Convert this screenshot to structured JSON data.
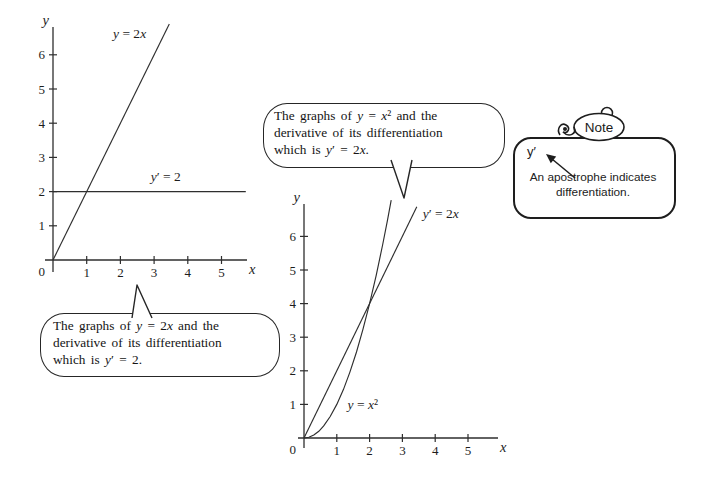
{
  "palette": {
    "ink": "#2e2e2e",
    "paper": "#ffffff"
  },
  "chart_data": [
    {
      "type": "line",
      "title": "",
      "xlabel": "x",
      "ylabel": "y",
      "origin_label": "0",
      "x_ticks": [
        1,
        2,
        3,
        4,
        5
      ],
      "y_ticks": [
        1,
        2,
        3,
        4,
        5,
        6
      ],
      "xlim": [
        0,
        5.9
      ],
      "ylim": [
        0,
        7
      ],
      "grid": false,
      "legend": "labels-on-plot",
      "series": [
        {
          "name": "y-equals-2x",
          "equation": "y = 2x",
          "label_segments": [
            {
              "t": "y",
              "i": true
            },
            {
              "t": " = 2"
            },
            {
              "t": "x",
              "i": true
            }
          ],
          "points": [
            [
              0,
              0
            ],
            [
              3.45,
              6.9
            ]
          ],
          "label_xy": [
            1.78,
            6.5
          ]
        },
        {
          "name": "y-prime-equals-2",
          "equation": "y′ = 2",
          "label_segments": [
            {
              "t": "y",
              "i": true
            },
            {
              "t": "′ = 2"
            }
          ],
          "points": [
            [
              0,
              2
            ],
            [
              5.72,
              2
            ]
          ],
          "label_xy": [
            2.9,
            2.32
          ]
        }
      ]
    },
    {
      "type": "line",
      "title": "",
      "xlabel": "x",
      "ylabel": "y",
      "origin_label": "0",
      "x_ticks": [
        1,
        2,
        3,
        4,
        5
      ],
      "y_ticks": [
        1,
        2,
        3,
        4,
        5,
        6
      ],
      "xlim": [
        0,
        5.9
      ],
      "ylim": [
        0,
        7
      ],
      "grid": false,
      "legend": "labels-on-plot",
      "series": [
        {
          "name": "y-equals-x-squared",
          "equation": "y = x²",
          "label_segments": [
            {
              "t": "y",
              "i": true
            },
            {
              "t": " = "
            },
            {
              "t": "x",
              "i": true
            },
            {
              "t": "²"
            }
          ],
          "points": [
            [
              0,
              0
            ],
            [
              0.15,
              0.02
            ],
            [
              0.3,
              0.09
            ],
            [
              0.45,
              0.2
            ],
            [
              0.6,
              0.36
            ],
            [
              0.8,
              0.64
            ],
            [
              1,
              1
            ],
            [
              1.2,
              1.44
            ],
            [
              1.4,
              1.96
            ],
            [
              1.6,
              2.56
            ],
            [
              1.8,
              3.24
            ],
            [
              2,
              4
            ],
            [
              2.2,
              4.84
            ],
            [
              2.4,
              5.76
            ],
            [
              2.55,
              6.5
            ],
            [
              2.66,
              7.08
            ]
          ],
          "label_xy": [
            1.33,
            0.87
          ]
        },
        {
          "name": "y-prime-equals-2x",
          "equation": "y′ = 2x",
          "label_segments": [
            {
              "t": "y",
              "i": true
            },
            {
              "t": "′ = 2"
            },
            {
              "t": "x",
              "i": true
            }
          ],
          "points": [
            [
              0,
              0
            ],
            [
              3.44,
              6.88
            ]
          ],
          "label_xy": [
            3.62,
            6.55
          ]
        }
      ]
    }
  ],
  "bubbles": {
    "left": {
      "lines": [
        [
          {
            "t": "The graphs of "
          },
          {
            "t": "y",
            "i": true
          },
          {
            "t": " = 2"
          },
          {
            "t": "x",
            "i": true
          },
          {
            "t": " and the"
          }
        ],
        [
          {
            "t": "derivative of its differentiation"
          }
        ],
        [
          {
            "t": "which is "
          },
          {
            "t": "y",
            "i": true
          },
          {
            "t": "′ = 2."
          }
        ]
      ]
    },
    "middle": {
      "lines": [
        [
          {
            "t": "The graphs of "
          },
          {
            "t": "y",
            "i": true
          },
          {
            "t": " = "
          },
          {
            "t": "x",
            "i": true
          },
          {
            "t": "²"
          },
          {
            "t": " and the"
          }
        ],
        [
          {
            "t": "derivative of its differentiation"
          }
        ],
        [
          {
            "t": "which is "
          },
          {
            "t": "y",
            "i": true
          },
          {
            "t": "′ = 2"
          },
          {
            "t": "x",
            "i": true
          },
          {
            "t": "."
          }
        ]
      ]
    }
  },
  "note": {
    "title": "Note",
    "symbol": "y′",
    "caption_line1": "An apostrophe indicates",
    "caption_line2": "differentiation."
  }
}
